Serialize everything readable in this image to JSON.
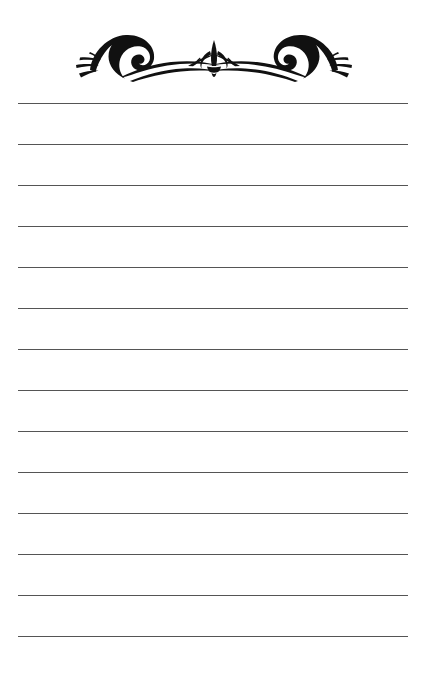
{
  "page": {
    "kind": "lined-stationery-sheet",
    "width": 427,
    "height": 675,
    "background_color": "#ffffff"
  },
  "ornament": {
    "name": "decorative-flourish-divider",
    "description": "Symmetric calligraphic flourish: mirrored spiral scrolls with radiating leaf strokes joined by swooping tapered curves, centered fleur-de-lis",
    "center_motif": "fleur-de-lis",
    "ink_color": "#111111",
    "left_px": 70,
    "top_px": 22,
    "width_px": 288,
    "height_px": 60,
    "symmetry": "horizontal-mirror"
  },
  "rules": {
    "name": "ruled-writing-lines",
    "count": 14,
    "color": "#555555",
    "thickness_px": 1,
    "left_px": 18,
    "right_px": 408,
    "length_px": 390,
    "first_line_y": 103,
    "spacing_px": 41,
    "y_positions": [
      103,
      144,
      185,
      226,
      267,
      308,
      349,
      390,
      431,
      472,
      513,
      554,
      595,
      636
    ]
  }
}
